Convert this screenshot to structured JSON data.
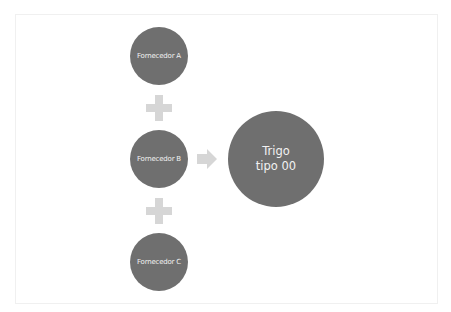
{
  "diagram": {
    "colors": {
      "node_fill": "#6f6f6f",
      "node_text": "#f2f2f2",
      "connector": "#d6d6d6",
      "frame": "#f0f0f0"
    },
    "inputs": [
      {
        "label": "Fornecedor A"
      },
      {
        "label": "Fornecedor B"
      },
      {
        "label": "Fornecedor C"
      }
    ],
    "operators": [
      "plus-icon",
      "plus-icon"
    ],
    "connector": "arrow-right-icon",
    "output": {
      "label": "Trigo\ntipo 00"
    }
  }
}
